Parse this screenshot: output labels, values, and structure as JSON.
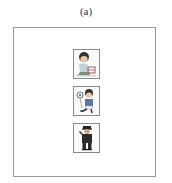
{
  "caption": "(a)",
  "figures": [
    {
      "name": "child-playing-figure",
      "description": "child crouching with toy"
    },
    {
      "name": "child-with-ball-figure",
      "description": "child kicking a ball"
    },
    {
      "name": "police-officer-figure",
      "description": "person in dark uniform saluting"
    }
  ],
  "colors": {
    "frame_border": "#9a9a9a",
    "box_border": "#8a8a8a",
    "hair": "#333333",
    "skin": "#e8c9a8",
    "uniform": "#2a2a2a",
    "shirt_light": "#bcd3d9",
    "shirt_blue": "#5a78a0"
  }
}
